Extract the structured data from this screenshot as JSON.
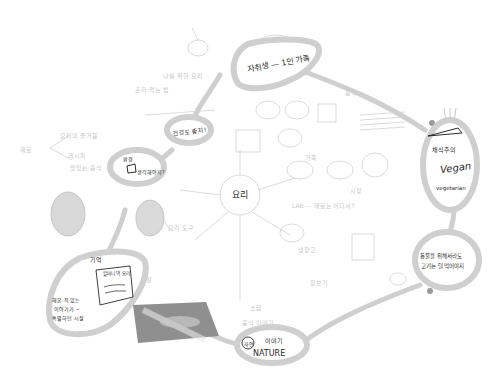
{
  "center": {
    "label": "요리"
  },
  "main_nodes": [
    {
      "id": "single-household",
      "label": "자취생 — 1인 가족"
    },
    {
      "id": "vegan",
      "label_ko": "채식주의",
      "label_en": "Vegan",
      "sub": "vegetarian"
    },
    {
      "id": "animals",
      "line1": "동물을 위해서라도",
      "line2": "고기는 덜 먹어야지"
    },
    {
      "id": "nature",
      "circle": "자연",
      "label_ko": "이야기",
      "label_en": "NATURE"
    },
    {
      "id": "memory",
      "tag": "기억",
      "card": "할머니 댁 요리",
      "note1": "해본 적 없는",
      "note2": "이야기가 ~",
      "note3": "특별하던 시절"
    },
    {
      "id": "environment",
      "line1": "환경",
      "line2": "생각해야지?"
    },
    {
      "id": "health",
      "label": "건강도 좋지!"
    }
  ],
  "faint_notes": [
    "나를 위한 요리",
    "혼자 먹는 밥",
    "요리의 즐거움",
    "맛있는 음식",
    "재료",
    "레시피",
    "음악",
    "가족",
    "친구",
    "시장",
    "LAB — 재료는 어디서?",
    "냉장고",
    "장보기",
    "요리 도구",
    "계절",
    "농부",
    "텃밭",
    "조리법",
    "소금",
    "음식 이야기"
  ],
  "colors": {
    "ink": "#2a2a2a",
    "blob": "#cfcfcf",
    "faint": "#d2d2d2",
    "photo": "#8f8f8f"
  }
}
